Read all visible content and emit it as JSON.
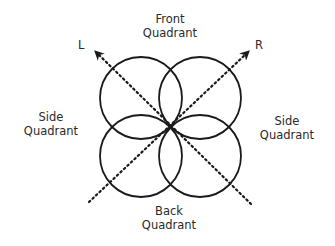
{
  "diagram": {
    "type": "polar-pattern",
    "center": [
      170,
      127
    ],
    "circle_radius": 41,
    "stroke_color": "#1a1a1a",
    "circles": [
      {
        "name": "front-left-lobe",
        "cx": 141,
        "cy": 98
      },
      {
        "name": "front-right-lobe",
        "cx": 200,
        "cy": 98
      },
      {
        "name": "back-left-lobe",
        "cx": 141,
        "cy": 156
      },
      {
        "name": "back-right-lobe",
        "cx": 200,
        "cy": 156
      }
    ],
    "axes": [
      {
        "name": "L",
        "label": "L",
        "from": [
          251,
          204
        ],
        "to": [
          93,
          49
        ]
      },
      {
        "name": "R",
        "label": "R",
        "from": [
          89,
          202
        ],
        "to": [
          251,
          49
        ]
      }
    ]
  },
  "labels": {
    "front": {
      "line1": "Front",
      "line2": "Quadrant"
    },
    "back": {
      "line1": "Back",
      "line2": "Quadrant"
    },
    "side_left": {
      "line1": "Side",
      "line2": "Quadrant"
    },
    "side_right": {
      "line1": "Side",
      "line2": "Quadrant"
    },
    "axis_l": "L",
    "axis_r": "R"
  }
}
